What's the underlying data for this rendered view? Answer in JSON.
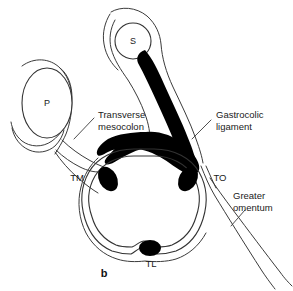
{
  "figure": {
    "panel_letter": "b",
    "background_color": "#ffffff",
    "line_color": "#333333",
    "fill_color": "#000000",
    "width": 293,
    "height": 291,
    "organ_labels": [
      {
        "id": "pancreas",
        "text": "P",
        "x": 47,
        "y": 103
      },
      {
        "id": "stomach",
        "text": "S",
        "x": 133,
        "y": 42
      }
    ],
    "abbreviation_labels": [
      {
        "id": "taenia-mesocolica",
        "text": "TM",
        "x": 77,
        "y": 181
      },
      {
        "id": "taenia-omentalis",
        "text": "TO",
        "x": 220,
        "y": 181
      },
      {
        "id": "taenia-libera",
        "text": "TL",
        "x": 151,
        "y": 265
      }
    ],
    "callouts": [
      {
        "id": "transverse-mesocolon",
        "line1": "Transverse",
        "line2": "mesocolon",
        "x": 98,
        "y": 118
      },
      {
        "id": "gastrocolic-ligament",
        "line1": "Gastrocolic",
        "line2": "ligament",
        "x": 216,
        "y": 118
      },
      {
        "id": "greater-omentum",
        "line1": "Greater",
        "line2": "omentum",
        "x": 233,
        "y": 199
      }
    ],
    "structures": [
      {
        "id": "pancreas-outline",
        "name": "pancreas"
      },
      {
        "id": "stomach-outline",
        "name": "stomach"
      },
      {
        "id": "transverse-colon-outline",
        "name": "transverse colon"
      },
      {
        "id": "gastrocolic-ligament-band",
        "name": "gastrocolic ligament"
      },
      {
        "id": "transverse-mesocolon-leaf",
        "name": "transverse mesocolon"
      },
      {
        "id": "greater-omentum-tail",
        "name": "greater omentum"
      },
      {
        "id": "taenia-spots",
        "name": "taeniae coli"
      }
    ]
  }
}
